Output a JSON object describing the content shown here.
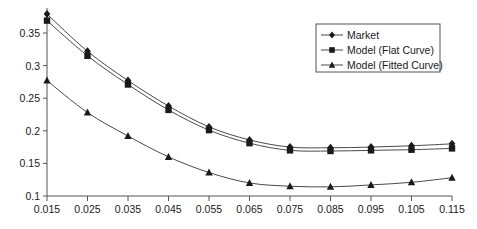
{
  "chart_data": {
    "type": "line",
    "title": "",
    "xlabel": "",
    "ylabel": "",
    "xlim": [
      0.015,
      0.115
    ],
    "ylim": [
      0.1,
      0.375
    ],
    "grid": false,
    "legend_position": "top-right",
    "x": [
      0.015,
      0.025,
      0.035,
      0.045,
      0.055,
      0.065,
      0.075,
      0.085,
      0.095,
      0.105,
      0.115
    ],
    "xticks": [
      "0.015",
      "0.025",
      "0.035",
      "0.045",
      "0.055",
      "0.065",
      "0.075",
      "0.085",
      "0.095",
      "0.105",
      "0.115"
    ],
    "yticks": [
      "0.1",
      "0.15",
      "0.2",
      "0.25",
      "0.3",
      "0.35"
    ],
    "ytick_values": [
      0.1,
      0.15,
      0.2,
      0.25,
      0.3,
      0.35
    ],
    "series": [
      {
        "name": "Market",
        "marker": "diamond",
        "values": [
          0.379,
          0.322,
          0.277,
          0.238,
          0.206,
          0.186,
          0.175,
          0.174,
          0.175,
          0.177,
          0.18
        ]
      },
      {
        "name": "Model (Flat Curve)",
        "marker": "square",
        "values": [
          0.369,
          0.315,
          0.271,
          0.232,
          0.201,
          0.181,
          0.17,
          0.169,
          0.17,
          0.171,
          0.173
        ]
      },
      {
        "name": "Model (Fitted Curve)",
        "marker": "triangle",
        "values": [
          0.277,
          0.228,
          0.192,
          0.16,
          0.136,
          0.12,
          0.115,
          0.114,
          0.117,
          0.121,
          0.128
        ]
      }
    ]
  },
  "legend": {
    "entries": [
      {
        "label": "Market",
        "marker": "diamond"
      },
      {
        "label": "Model (Flat Curve)",
        "marker": "square"
      },
      {
        "label": "Model (Fitted Curve)",
        "marker": "triangle"
      }
    ]
  },
  "colors": {
    "line": "#4a4a4a",
    "marker": "#1a1a1a",
    "axis": "#555555",
    "background": "#ffffff"
  }
}
